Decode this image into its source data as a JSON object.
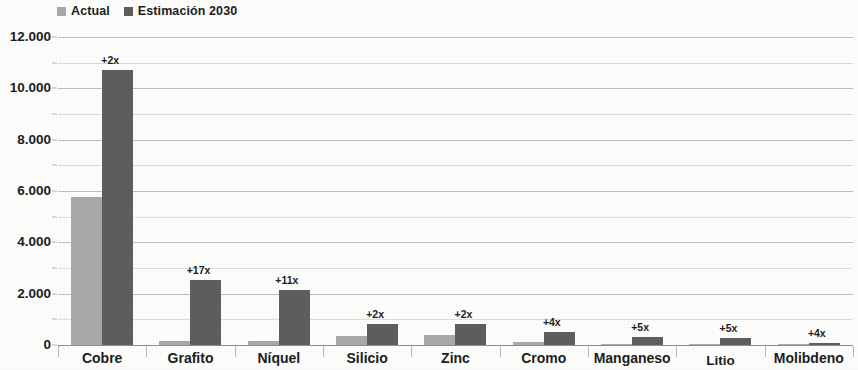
{
  "legend": {
    "position": "top-left",
    "entries": [
      {
        "label": "Actual",
        "color": "#a9a9a7",
        "icon": "square-swatch"
      },
      {
        "label": "Estimación 2030",
        "color": "#5e5e5c",
        "icon": "square-swatch"
      }
    ]
  },
  "axis": {
    "y_ticks": [
      "0",
      "2.000",
      "4.000",
      "6.000",
      "8.000",
      "10.000",
      "12.000"
    ]
  },
  "chart_data": {
    "type": "bar",
    "title": "",
    "xlabel": "",
    "ylabel": "",
    "ylim": [
      0,
      12000
    ],
    "ytick_step": 2000,
    "minor_gridline_step": 1000,
    "grid": true,
    "legend_position": "top-left",
    "categories": [
      "Cobre",
      "Grafito",
      "Níquel",
      "Silicio",
      "Zinc",
      "Cromo",
      "Manganeso",
      "Litio",
      "Molibdeno"
    ],
    "series": [
      {
        "name": "Actual",
        "color": "#a9a9a7",
        "values": [
          5750,
          150,
          170,
          350,
          400,
          100,
          50,
          20,
          20
        ]
      },
      {
        "name": "Estimación 2030",
        "color": "#5e5e5c",
        "values": [
          10700,
          2530,
          2140,
          820,
          830,
          520,
          320,
          270,
          70
        ]
      }
    ],
    "annotations": [
      "+2x",
      "+17x",
      "+11x",
      "+2x",
      "+2x",
      "+4x",
      "+5x",
      "+5x",
      "+4x"
    ]
  }
}
